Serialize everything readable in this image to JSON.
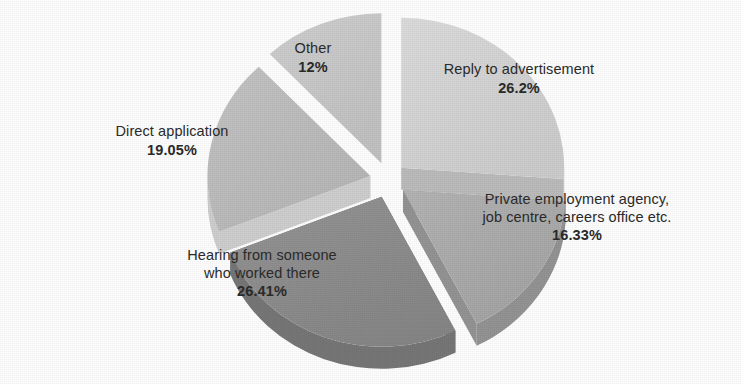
{
  "chart_data": {
    "type": "pie",
    "title": "",
    "subtitle": "",
    "xlabel": "",
    "ylabel": "",
    "legend_position": "none",
    "grid": false,
    "style": "exploded 3D pie, grayscale",
    "categories": [
      "Reply to advertisement",
      "Private employment agency, job centre, careers office etc.",
      "Hearing from someone who worked there",
      "Direct application",
      "Other"
    ],
    "values": [
      26.2,
      16.33,
      26.41,
      19.05,
      12
    ],
    "value_labels": [
      "26.2%",
      "16.33%",
      "26.41%",
      "19.05%",
      "12%"
    ],
    "units": "percent",
    "total": 99.99,
    "slices": [
      {
        "label": "Reply to advertisement",
        "label_lines": [
          "Reply to advertisement"
        ],
        "value": 26.2,
        "value_label": "26.2%",
        "color": "#d4d4d4",
        "side_color": "#bcbcbc",
        "start_angle": 0,
        "end_angle": 94.32
      },
      {
        "label": "Private employment agency, job centre, careers office etc.",
        "label_lines": [
          "Private employment agency,",
          "job centre, careers office etc."
        ],
        "value": 16.33,
        "value_label": "16.33%",
        "color": "#adadad",
        "side_color": "#949494",
        "start_angle": 94.32,
        "end_angle": 153.11
      },
      {
        "label": "Hearing from someone who worked there",
        "label_lines": [
          "Hearing from someone",
          "who worked there"
        ],
        "value": 26.41,
        "value_label": "26.41%",
        "color": "#8d8d8d",
        "side_color": "#777777",
        "start_angle": 153.11,
        "end_angle": 248.19
      },
      {
        "label": "Direct application",
        "label_lines": [
          "Direct application"
        ],
        "value": 19.05,
        "value_label": "19.05%",
        "color": "#bdbdbd",
        "side_color": "#cfcfcf",
        "start_angle": 248.19,
        "end_angle": 316.77
      },
      {
        "label": "Other",
        "label_lines": [
          "Other"
        ],
        "value": 12,
        "value_label": "12%",
        "color": "#c9c9c9",
        "side_color": "#b2b2b2",
        "start_angle": 316.77,
        "end_angle": 360
      }
    ]
  },
  "labels": {
    "reply": {
      "line1": "Reply to advertisement",
      "value": "26.2%"
    },
    "agency": {
      "line1": "Private employment agency,",
      "line2": "job centre, careers office etc.",
      "value": "16.33%"
    },
    "hearing": {
      "line1": "Hearing from someone",
      "line2": "who worked there",
      "value": "26.41%"
    },
    "direct": {
      "line1": "Direct application",
      "value": "19.05%"
    },
    "other": {
      "line1": "Other",
      "value": "12%"
    }
  },
  "colors": {
    "background": "#ffffff",
    "text": "#2b2b2b",
    "slice_reply": "#d4d4d4",
    "slice_agency": "#adadad",
    "slice_hearing": "#8d8d8d",
    "slice_direct": "#bdbdbd",
    "slice_other": "#c9c9c9"
  }
}
